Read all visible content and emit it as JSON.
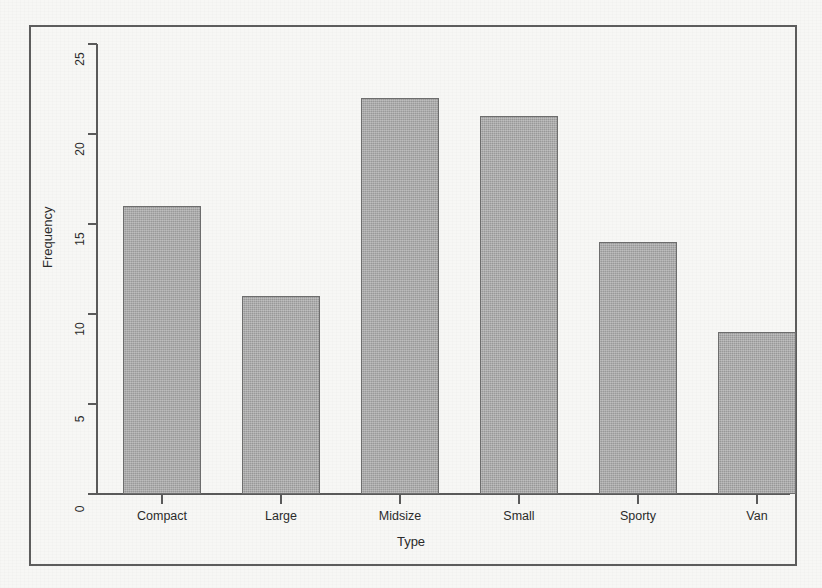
{
  "chart_data": {
    "type": "bar",
    "title": "",
    "subtitle": "",
    "xlabel": "Type",
    "ylabel": "Frequency",
    "categories": [
      "Compact",
      "Large",
      "Midsize",
      "Small",
      "Sporty",
      "Van"
    ],
    "values": [
      16,
      11,
      22,
      21,
      14,
      9
    ],
    "ylim": [
      0,
      25
    ],
    "y_ticks": [
      0,
      5,
      10,
      15,
      20,
      25
    ],
    "y_tick_labels": [
      "0",
      "5",
      "10",
      "15",
      "20",
      "25"
    ],
    "grid": false,
    "legend": null,
    "bar_fill_color": "#9a9a9a",
    "bar_border_color": "#6e6e6e",
    "axis_color": "#5b5b5b",
    "frame_color": "#5d5d5d",
    "background_color": "#f7f7f5",
    "annotations": []
  },
  "figure": {
    "frame_visible": true,
    "axis_tick_direction": "outward"
  }
}
